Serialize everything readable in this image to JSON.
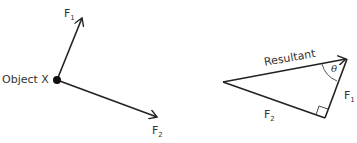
{
  "left_diagram": {
    "object_label": "Object X",
    "force1": {
      "name": "F",
      "sub": "1"
    },
    "force2": {
      "name": "F",
      "sub": "2"
    }
  },
  "right_diagram": {
    "resultant_label": "Resultant",
    "angle_label": "θ",
    "force1": {
      "name": "F",
      "sub": "1"
    },
    "force2": {
      "name": "F",
      "sub": "2"
    },
    "right_angle_marker": true
  },
  "colors": {
    "line": "#222222",
    "text": "#333333",
    "background": "#ffffff"
  }
}
